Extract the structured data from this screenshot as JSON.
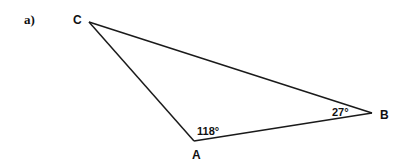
{
  "part_label": "a)",
  "triangle": {
    "vertices": [
      {
        "name": "A",
        "label": "A",
        "x": 194,
        "y": 141
      },
      {
        "name": "B",
        "label": "B",
        "x": 372,
        "y": 113
      },
      {
        "name": "C",
        "label": "C",
        "x": 89,
        "y": 22
      }
    ],
    "angles": [
      {
        "vertex": "A",
        "label": "118°",
        "value": 118
      },
      {
        "vertex": "B",
        "label": "27°",
        "value": 27
      }
    ],
    "stroke_color": "#1a1a1a"
  }
}
